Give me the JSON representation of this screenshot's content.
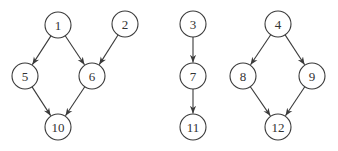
{
  "diagram": {
    "type": "directed-graph",
    "node_radius": 13,
    "colors": {
      "stroke": "#3a3a3a",
      "fill": "#ffffff",
      "text": "#333333"
    },
    "nodes": [
      {
        "id": "1",
        "label": "1",
        "x": 58,
        "y": 25
      },
      {
        "id": "2",
        "label": "2",
        "x": 125,
        "y": 24
      },
      {
        "id": "5",
        "label": "5",
        "x": 25,
        "y": 76
      },
      {
        "id": "6",
        "label": "6",
        "x": 92,
        "y": 76
      },
      {
        "id": "10",
        "label": "10",
        "x": 58,
        "y": 127
      },
      {
        "id": "3",
        "label": "3",
        "x": 193,
        "y": 24
      },
      {
        "id": "7",
        "label": "7",
        "x": 193,
        "y": 76
      },
      {
        "id": "11",
        "label": "11",
        "x": 193,
        "y": 127
      },
      {
        "id": "4",
        "label": "4",
        "x": 278,
        "y": 24
      },
      {
        "id": "8",
        "label": "8",
        "x": 243,
        "y": 76
      },
      {
        "id": "9",
        "label": "9",
        "x": 312,
        "y": 76
      },
      {
        "id": "12",
        "label": "12",
        "x": 278,
        "y": 127
      }
    ],
    "edges": [
      {
        "from": "1",
        "to": "5"
      },
      {
        "from": "1",
        "to": "6"
      },
      {
        "from": "2",
        "to": "6"
      },
      {
        "from": "5",
        "to": "10"
      },
      {
        "from": "6",
        "to": "10"
      },
      {
        "from": "3",
        "to": "7"
      },
      {
        "from": "7",
        "to": "11"
      },
      {
        "from": "4",
        "to": "8"
      },
      {
        "from": "4",
        "to": "9"
      },
      {
        "from": "8",
        "to": "12"
      },
      {
        "from": "9",
        "to": "12"
      }
    ]
  }
}
